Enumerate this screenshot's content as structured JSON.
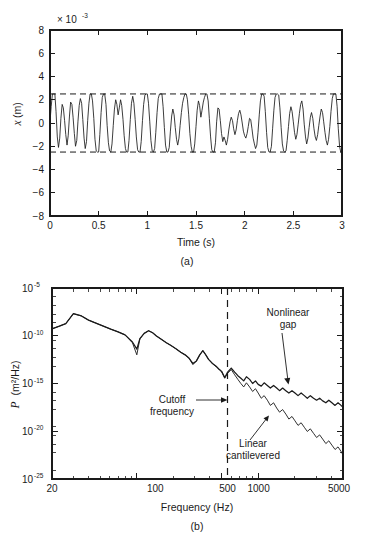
{
  "figure": {
    "background": "#ffffff",
    "line_color": "#1a1a1a"
  },
  "panel_a": {
    "caption": "(a)",
    "multiplier": "× 10",
    "multiplier_exp": "-3",
    "xlabel": "Time (s)",
    "ylabel_symbol": "x",
    "ylabel_unit": " (m)",
    "xticks": [
      "0",
      "0.5",
      "1",
      "1.5",
      "2",
      "2.5",
      "3"
    ],
    "yticks": [
      "8",
      "6",
      "4",
      "2",
      "0",
      "−2",
      "−4",
      "−6",
      "−8"
    ],
    "limit_upper_label": "2.5e-3",
    "limit_lower_label": "-2.5e-3"
  },
  "panel_b": {
    "caption": "(b)",
    "xlabel": "Frequency (Hz)",
    "ylabel_symbol": "P",
    "ylabel_unit": " (m²/Hz)",
    "xticks": [
      "20",
      "100",
      "500",
      "1000",
      "5000"
    ],
    "yticks": [
      {
        "mantissa": "10",
        "exp": "-5"
      },
      {
        "mantissa": "10",
        "exp": "-10"
      },
      {
        "mantissa": "10",
        "exp": "-15"
      },
      {
        "mantissa": "10",
        "exp": "-20"
      },
      {
        "mantissa": "10",
        "exp": "-25"
      }
    ],
    "annotations": {
      "cutoff_line1": "Cutoff",
      "cutoff_line2": "frequency",
      "nonlinear_line1": "Nonlinear",
      "nonlinear_line2": "gap",
      "linear_line1": "Linear",
      "linear_line2": "cantilevered"
    }
  },
  "chart_data": [
    {
      "type": "line",
      "id": "panel-a-timeseries",
      "title": "",
      "xlabel": "Time (s)",
      "ylabel": "x (m)",
      "xlim": [
        0,
        3
      ],
      "ylim": [
        -0.008,
        0.008
      ],
      "y_multiplier": 0.001,
      "grid": false,
      "legend": "none",
      "annotations": [
        {
          "text": "(a)",
          "role": "panel-caption"
        },
        {
          "text": "× 10⁻³",
          "role": "y-axis-multiplier"
        }
      ],
      "reference_lines": [
        {
          "orientation": "horizontal",
          "value": 0.0025,
          "style": "dashed"
        },
        {
          "orientation": "horizontal",
          "value": -0.0025,
          "style": "dashed"
        }
      ],
      "series": [
        {
          "name": "displacement",
          "description": "Chaotic impacting oscillator displacement, clipped at ±2.5e-3 m",
          "x": [
            0,
            0.012,
            0.025,
            0.037,
            0.05,
            0.062,
            0.075,
            0.087,
            0.1,
            0.112,
            0.125,
            0.137,
            0.15,
            0.162,
            0.175,
            0.187,
            0.2,
            0.212,
            0.225,
            0.237,
            0.25,
            0.262,
            0.275,
            0.287,
            0.3,
            0.312,
            0.325,
            0.337,
            0.35,
            0.362,
            0.375,
            0.387,
            0.4,
            0.412,
            0.425,
            0.437,
            0.45,
            0.462,
            0.475,
            0.487,
            0.5,
            0.512,
            0.525,
            0.537,
            0.55,
            0.562,
            0.575,
            0.587,
            0.6,
            0.612,
            0.625,
            0.637,
            0.65,
            0.662,
            0.675,
            0.687,
            0.7,
            0.712,
            0.725,
            0.737,
            0.75,
            0.762,
            0.775,
            0.787,
            0.8,
            0.812,
            0.825,
            0.837,
            0.85,
            0.862,
            0.875,
            0.887,
            0.9,
            0.912,
            0.925,
            0.937,
            0.95,
            0.962,
            0.975,
            0.987,
            1,
            1.012,
            1.025,
            1.037,
            1.05,
            1.062,
            1.075,
            1.087,
            1.1,
            1.112,
            1.125,
            1.137,
            1.15,
            1.162,
            1.175,
            1.187,
            1.2,
            1.212,
            1.225,
            1.237,
            1.25,
            1.262,
            1.275,
            1.287,
            1.3,
            1.312,
            1.325,
            1.337,
            1.35,
            1.362,
            1.375,
            1.387,
            1.4,
            1.412,
            1.425,
            1.437,
            1.45,
            1.462,
            1.475,
            1.487,
            1.5,
            1.512,
            1.525,
            1.537,
            1.55,
            1.562,
            1.575,
            1.587,
            1.6,
            1.612,
            1.625,
            1.637,
            1.65,
            1.662,
            1.675,
            1.687,
            1.7,
            1.712,
            1.725,
            1.737,
            1.75,
            1.762,
            1.775,
            1.787,
            1.8,
            1.812,
            1.825,
            1.837,
            1.85,
            1.862,
            1.875,
            1.887,
            1.9,
            1.912,
            1.925,
            1.937,
            1.95,
            1.962,
            1.975,
            1.987,
            2,
            2.012,
            2.025,
            2.037,
            2.05,
            2.062,
            2.075,
            2.087,
            2.1,
            2.112,
            2.125,
            2.137,
            2.15,
            2.162,
            2.175,
            2.187,
            2.2,
            2.212,
            2.225,
            2.237,
            2.25,
            2.262,
            2.275,
            2.287,
            2.3,
            2.312,
            2.325,
            2.337,
            2.35,
            2.362,
            2.375,
            2.387,
            2.4,
            2.412,
            2.425,
            2.437,
            2.45,
            2.462,
            2.475,
            2.487,
            2.5,
            2.512,
            2.525,
            2.537,
            2.55,
            2.562,
            2.575,
            2.587,
            2.6,
            2.612,
            2.625,
            2.637,
            2.65,
            2.662,
            2.675,
            2.687,
            2.7,
            2.712,
            2.725,
            2.737,
            2.75,
            2.762,
            2.775,
            2.787,
            2.8,
            2.812,
            2.825,
            2.837,
            2.85,
            2.862,
            2.875,
            2.887,
            2.9,
            2.912,
            2.925,
            2.937,
            2.95,
            2.962,
            2.975,
            2.987,
            3
          ],
          "y_scaled_1e3": [
            0.1,
            1.4,
            2.5,
            2.5,
            2.5,
            1.0,
            -1.2,
            -2.1,
            -1.3,
            0.4,
            1.6,
            1.3,
            0.2,
            -1.0,
            -1.9,
            -1.1,
            0.6,
            1.8,
            1.6,
            0.5,
            -0.9,
            -2.0,
            -1.5,
            0.1,
            1.5,
            2.1,
            1.7,
            0.3,
            -1.3,
            -2.2,
            -1.6,
            0.2,
            1.7,
            2.5,
            2.5,
            1.9,
            0.4,
            -1.4,
            -2.4,
            -2.5,
            -2.5,
            -1.0,
            0.9,
            2.2,
            2.5,
            2.5,
            1.6,
            -0.2,
            -1.7,
            -2.4,
            -2.5,
            -1.8,
            -0.2,
            1.2,
            2.0,
            1.6,
            0.7,
            1.3,
            2.0,
            1.5,
            0.3,
            -1.1,
            -2.2,
            -2.5,
            -2.5,
            -1.5,
            0.3,
            1.7,
            2.3,
            1.7,
            0.3,
            -1.2,
            -2.3,
            -2.5,
            -2.5,
            -1.6,
            0.2,
            1.6,
            2.4,
            2.5,
            2.5,
            1.7,
            0.1,
            -1.5,
            -2.4,
            -2.5,
            -2.2,
            -0.8,
            0.9,
            2.1,
            2.5,
            2.5,
            2.5,
            1.4,
            -0.4,
            -1.9,
            -2.5,
            -2.5,
            -2.1,
            -0.7,
            0.6,
            1.2,
            0.7,
            -0.4,
            -1.4,
            -1.9,
            -1.3,
            -0.2,
            0.9,
            1.7,
            2.2,
            2.5,
            2.5,
            2.0,
            0.7,
            -0.9,
            -2.0,
            -2.5,
            -2.5,
            -1.8,
            -0.3,
            1.1,
            1.9,
            1.5,
            0.5,
            1.1,
            1.8,
            2.2,
            2.5,
            2.5,
            1.9,
            0.4,
            -1.2,
            -2.3,
            -2.5,
            -2.5,
            -1.7,
            0.1,
            1.3,
            1.2,
            0.2,
            -0.9,
            -1.6,
            -1.2,
            -1.5,
            -1.9,
            -1.4,
            -0.6,
            0.1,
            0.5,
            0.2,
            -0.5,
            -1.0,
            -0.6,
            0.2,
            0.8,
            1.1,
            0.7,
            0.0,
            -0.7,
            -1.1,
            -1.3,
            -0.9,
            -0.3,
            0.4,
            0.3,
            -0.5,
            -1.3,
            -1.8,
            -2.2,
            -1.9,
            -0.8,
            0.7,
            1.9,
            2.5,
            2.5,
            2.3,
            1.0,
            -0.8,
            -2.1,
            -2.5,
            -2.5,
            -2.0,
            -0.5,
            1.1,
            2.2,
            2.5,
            2.5,
            2.4,
            1.3,
            -0.4,
            -1.8,
            -2.4,
            -2.5,
            -2.4,
            -1.5,
            -0.3,
            0.8,
            1.4,
            1.0,
            0.1,
            -0.8,
            -1.4,
            -1.0,
            -0.1,
            0.8,
            1.6,
            1.9,
            1.2,
            -0.1,
            -1.2,
            -1.8,
            -1.3,
            -0.4,
            0.5,
            0.9,
            0.4,
            -0.5,
            -1.2,
            -1.5,
            -1.0,
            -0.2,
            0.6,
            1.2,
            0.9,
            0.1,
            -0.8,
            -1.5,
            -1.9,
            -1.4,
            -0.3,
            1.0,
            2.1,
            2.5,
            2.5,
            2.5,
            1.4,
            -0.5,
            -2.0,
            -2.5,
            -2.5,
            -2.5,
            -1.3,
            0.6,
            2.0,
            2.5,
            2.5,
            2.5,
            1.8,
            0.3,
            2.5
          ]
        }
      ]
    },
    {
      "type": "line",
      "id": "panel-b-psd",
      "title": "",
      "xlabel": "Frequency (Hz)",
      "ylabel": "P (m²/Hz)",
      "xscale": "log",
      "yscale": "log",
      "xlim": [
        20,
        5000
      ],
      "ylim": [
        1e-27,
        1e-05
      ],
      "grid": false,
      "legend": "inline-annotations",
      "reference_lines": [
        {
          "orientation": "vertical",
          "value": 500,
          "style": "dashed",
          "label": "Cutoff frequency"
        }
      ],
      "annotations": [
        {
          "text": "Cutoff frequency",
          "target_x": 500,
          "role": "cutoff-marker"
        },
        {
          "text": "Nonlinear gap",
          "target_x": 1600,
          "target_y": 1e-17,
          "role": "series-label"
        },
        {
          "text": "Linear cantilevered",
          "target_x": 1250,
          "target_y": 1e-20,
          "role": "series-label"
        },
        {
          "text": "(b)",
          "role": "panel-caption"
        }
      ],
      "series": [
        {
          "name": "Nonlinear gap",
          "x": [
            20,
            23,
            26,
            30,
            35,
            40,
            46,
            53,
            61,
            70,
            80,
            92,
            100,
            106,
            115,
            125,
            135,
            145,
            160,
            175,
            190,
            210,
            230,
            250,
            270,
            290,
            310,
            330,
            350,
            370,
            390,
            420,
            450,
            480,
            500,
            530,
            560,
            600,
            640,
            680,
            720,
            760,
            800,
            850,
            900,
            950,
            1000,
            1060,
            1120,
            1190,
            1260,
            1340,
            1420,
            1500,
            1590,
            1690,
            1790,
            1900,
            2010,
            2130,
            2260,
            2400,
            2540,
            2690,
            2860,
            3030,
            3210,
            3400,
            3610,
            3820,
            4050,
            4300,
            4550,
            4820,
            5000
          ],
          "y": [
            2e-10,
            4e-10,
            8e-10,
            1.1e-08,
            6e-09,
            2e-09,
            9e-10,
            4e-10,
            1.8e-10,
            9e-11,
            4e-11,
            6e-12,
            9e-13,
            1.5e-11,
            6e-11,
            1.2e-10,
            7e-11,
            3e-11,
            1.2e-11,
            5e-12,
            2.5e-12,
            1e-12,
            4e-13,
            2e-13,
            8e-14,
            2e-14,
            4e-14,
            2e-13,
            6e-13,
            2e-13,
            6e-14,
            2e-14,
            1e-14,
            4e-15,
            2.5e-15,
            5e-16,
            2e-15,
            6e-15,
            2e-15,
            8e-16,
            4e-16,
            2e-16,
            6e-16,
            3e-16,
            1e-16,
            2e-16,
            8e-17,
            5e-17,
            1.2e-16,
            6e-17,
            3e-17,
            6e-17,
            3e-17,
            1.5e-17,
            3e-17,
            1.5e-17,
            8e-18,
            1.5e-17,
            8e-18,
            4e-18,
            8e-18,
            4e-18,
            2e-18,
            4e-18,
            2e-18,
            1.2e-18,
            2e-18,
            1e-18,
            6e-19,
            1.2e-18,
            6e-19,
            3e-19,
            6e-19,
            3e-19,
            2e-19
          ]
        },
        {
          "name": "Linear cantilevered",
          "x": [
            20,
            23,
            26,
            30,
            35,
            40,
            46,
            53,
            61,
            70,
            80,
            92,
            100,
            106,
            115,
            125,
            135,
            145,
            160,
            175,
            190,
            210,
            230,
            250,
            270,
            290,
            310,
            330,
            350,
            370,
            390,
            420,
            450,
            480,
            500,
            530,
            560,
            600,
            640,
            680,
            720,
            760,
            800,
            850,
            900,
            950,
            1000,
            1060,
            1120,
            1190,
            1260,
            1340,
            1420,
            1500,
            1590,
            1690,
            1790,
            1900,
            2010,
            2130,
            2260,
            2400,
            2540,
            2690,
            2860,
            3030,
            3210,
            3400,
            3610,
            3820,
            4050,
            4300,
            4550,
            4820,
            5000
          ],
          "y": [
            2e-10,
            4e-10,
            8e-10,
            1.1e-08,
            6e-09,
            2e-09,
            9e-10,
            4e-10,
            1.8e-10,
            9e-11,
            4e-11,
            5e-12,
            2e-13,
            1.4e-11,
            6e-11,
            1.2e-10,
            7e-11,
            3e-11,
            1.2e-11,
            5e-12,
            2.5e-12,
            1e-12,
            4e-13,
            2e-13,
            8e-14,
            1.5e-14,
            4e-14,
            2e-13,
            6e-13,
            2e-13,
            6e-14,
            2e-14,
            9e-15,
            3.5e-15,
            2.2e-15,
            4e-16,
            1.5e-15,
            4e-15,
            1e-15,
            3e-16,
            1e-16,
            4e-17,
            1.2e-16,
            4e-17,
            1.2e-17,
            2.5e-17,
            8e-18,
            2e-18,
            4e-18,
            1.2e-18,
            3e-19,
            6e-19,
            1.5e-19,
            5e-20,
            1e-19,
            3e-20,
            8e-21,
            1.6e-20,
            5e-21,
            1.5e-21,
            3e-21,
            9e-22,
            3e-22,
            6e-22,
            1.8e-22,
            6e-23,
            1.2e-22,
            4e-23,
            1.2e-23,
            2.5e-23,
            8e-24,
            2.5e-24,
            5e-24,
            1.5e-24,
            6e-25
          ]
        }
      ]
    }
  ]
}
